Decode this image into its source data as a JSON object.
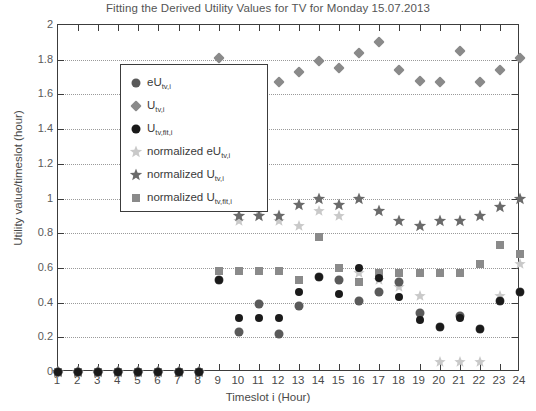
{
  "chart_data": {
    "type": "scatter",
    "title": "Fitting the Derived Utility Values for TV for Monday 15.07.2013",
    "xlabel": "Timeslot i (Hour)",
    "ylabel": "Utility value/timeslot (hour)",
    "xlim": [
      1,
      24
    ],
    "ylim": [
      0,
      2
    ],
    "xticks": [
      1,
      2,
      3,
      4,
      5,
      6,
      7,
      8,
      9,
      10,
      11,
      12,
      13,
      14,
      15,
      16,
      17,
      18,
      19,
      20,
      21,
      22,
      23,
      24
    ],
    "yticks": [
      0,
      0.2,
      0.4,
      0.6,
      0.8,
      1,
      1.2,
      1.4,
      1.6,
      1.8,
      2
    ],
    "ytick_labels": [
      "0",
      "0.2",
      "0.4",
      "0.6",
      "0.8",
      "1",
      "1.2",
      "1.4",
      "1.6",
      "1.8",
      "2"
    ],
    "grid": true,
    "legend_position": "upper left",
    "x": [
      1,
      2,
      3,
      4,
      5,
      6,
      7,
      8,
      9,
      10,
      11,
      12,
      13,
      14,
      15,
      16,
      17,
      18,
      19,
      20,
      21,
      22,
      23,
      24
    ],
    "series": [
      {
        "name": "eU",
        "sub": "tv,i",
        "marker": "circle",
        "color": "#5a5a5a",
        "size": 9,
        "values": [
          0,
          0,
          0,
          0,
          0,
          0,
          0,
          0,
          0.53,
          0.23,
          0.39,
          0.22,
          0.38,
          0.55,
          0.53,
          0.41,
          0.46,
          0.52,
          0.34,
          0.26,
          0.32,
          0.25,
          0.41,
          0.46
        ]
      },
      {
        "name": "U",
        "sub": "tv,i",
        "marker": "diamond",
        "color": "#8a8a8a",
        "size": 9,
        "values": [
          0,
          0,
          0,
          0,
          0,
          0,
          0,
          0,
          1.81,
          1.67,
          1.67,
          1.67,
          1.73,
          1.79,
          1.75,
          1.84,
          1.9,
          1.74,
          1.68,
          1.67,
          1.85,
          1.67,
          1.74,
          1.81
        ]
      },
      {
        "name": "U",
        "sub": "tv,fit,i",
        "marker": "circle",
        "color": "#1a1a1a",
        "size": 8,
        "values": [
          0,
          0,
          0,
          0,
          0,
          0,
          0,
          0,
          0.53,
          0.31,
          0.31,
          0.31,
          0.46,
          0.55,
          0.45,
          0.6,
          0.54,
          0.43,
          0.3,
          0.26,
          0.31,
          0.25,
          0.41,
          0.46
        ]
      },
      {
        "name": "normalized eU",
        "sub": "tv,i",
        "marker": "star",
        "color": "#c9c9c9",
        "size": 10,
        "values": [
          0,
          0,
          0,
          0,
          0,
          0,
          0,
          0,
          1.0,
          0.87,
          0.93,
          0.87,
          0.84,
          0.93,
          0.9,
          0.57,
          0.53,
          0.49,
          0.44,
          0.06,
          0.06,
          0.06,
          0.44,
          0.62
        ]
      },
      {
        "name": "normalized U",
        "sub": "tv,i",
        "marker": "star",
        "color": "#6a6a6a",
        "size": 11,
        "values": [
          0,
          0,
          0,
          0,
          0,
          0,
          0,
          0,
          1.0,
          0.9,
          0.9,
          0.9,
          0.96,
          1.0,
          0.96,
          1.0,
          0.93,
          0.87,
          0.84,
          0.87,
          0.87,
          0.9,
          0.95,
          1.0
        ]
      },
      {
        "name": "normalized U",
        "sub": "tv,fit,i",
        "marker": "square",
        "color": "#8a8a8a",
        "size": 8,
        "values": [
          0,
          0,
          0,
          0,
          0,
          0,
          0,
          0,
          0.58,
          0.58,
          0.58,
          0.58,
          0.53,
          0.78,
          0.6,
          0.52,
          0.57,
          0.57,
          0.57,
          0.57,
          0.57,
          0.62,
          0.73,
          0.68
        ]
      }
    ],
    "legend_entries": [
      {
        "label_main": "eU",
        "label_sub": "tv,i",
        "marker": "circle",
        "color": "#5a5a5a"
      },
      {
        "label_main": "U",
        "label_sub": "tv,i",
        "marker": "diamond",
        "color": "#8a8a8a"
      },
      {
        "label_main": "U",
        "label_sub": "tv,fit,i",
        "marker": "circle",
        "color": "#1a1a1a"
      },
      {
        "label_main": "normalized eU",
        "label_sub": "tv,i",
        "marker": "star",
        "color": "#c9c9c9"
      },
      {
        "label_main": "normalized U",
        "label_sub": "tv,i",
        "marker": "star",
        "color": "#6a6a6a"
      },
      {
        "label_main": "normalized U",
        "label_sub": "tv,fit,i",
        "marker": "square",
        "color": "#8a8a8a"
      }
    ]
  }
}
